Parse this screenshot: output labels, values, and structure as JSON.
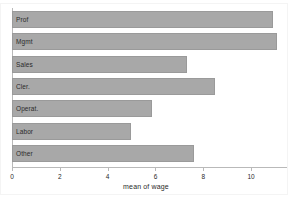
{
  "chart_data": {
    "type": "bar",
    "orientation": "horizontal",
    "title": "",
    "xlabel": "mean of wage",
    "ylabel": "",
    "categories": [
      "Prof",
      "Mgmt",
      "Sales",
      "Cler.",
      "Operat.",
      "Labor",
      "Other"
    ],
    "values": [
      10.9,
      11.1,
      7.3,
      8.5,
      5.85,
      4.98,
      7.6
    ],
    "xlim": [
      0,
      11.5
    ],
    "xticks": [
      0,
      2,
      4,
      6,
      8,
      10
    ],
    "xtick_labels": [
      "0",
      "2",
      "4",
      "6",
      "8",
      "10"
    ],
    "grid": false,
    "legend": null,
    "bar_color": "#a8a8a8",
    "bar_edge_color": "#9a9a9a",
    "axis_color": "#b9b9b9",
    "background_color": "#ffffff",
    "text_color": "#2a2a2a"
  },
  "axis": {
    "x_title": "mean of wage"
  }
}
